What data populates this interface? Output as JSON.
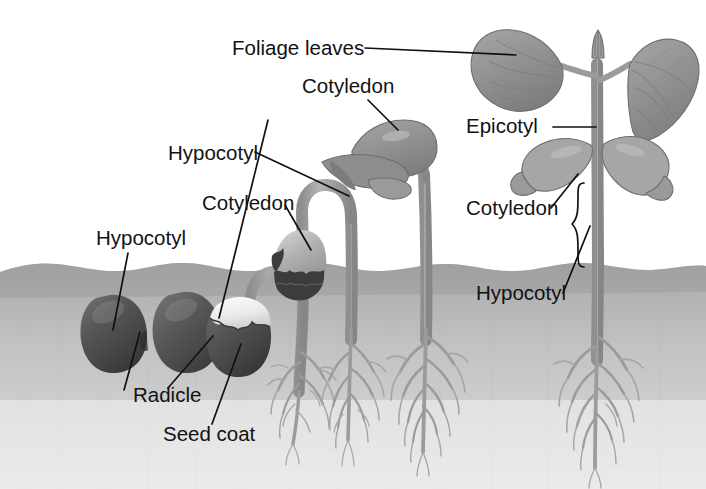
{
  "figure": {
    "background_color": "#ffffff",
    "soil_color": "#a7a7a7",
    "soil_color_light": "#c9c9c9",
    "seed_coat_color": "#4d4d4d",
    "cotyledon_color": "#9c9c9c",
    "leaf_color": "#939393",
    "stem_color": "#a0a0a0",
    "root_color": "#9b9b9b",
    "label_color": "#121212"
  },
  "labels": {
    "foliage_leaves": "Foliage leaves",
    "cotyledon_top": "Cotyledon",
    "hypocotyl_upper_left": "Hypocotyl",
    "cotyledon_mid_left": "Cotyledon",
    "hypocotyl_left": "Hypocotyl",
    "radicle": "Radicle",
    "seed_coat": "Seed coat",
    "epicotyl": "Epicotyl",
    "cotyledon_right": "Cotyledon",
    "hypocotyl_right": "Hypocotyl"
  },
  "label_positions": {
    "foliage_leaves": {
      "x": 232,
      "y": 55
    },
    "cotyledon_top": {
      "x": 302,
      "y": 93
    },
    "hypocotyl_upper_left": {
      "x": 168,
      "y": 160
    },
    "cotyledon_mid_left": {
      "x": 202,
      "y": 210
    },
    "hypocotyl_left": {
      "x": 96,
      "y": 245
    },
    "radicle": {
      "x": 133,
      "y": 402
    },
    "seed_coat": {
      "x": 163,
      "y": 441
    },
    "epicotyl": {
      "x": 466,
      "y": 133
    },
    "cotyledon_right": {
      "x": 466,
      "y": 215
    },
    "hypocotyl_right": {
      "x": 476,
      "y": 300
    }
  },
  "stages": [
    {
      "name": "seed-dormant",
      "description": "Dormant bean seed buried in soil"
    },
    {
      "name": "seed-radicle-emerging",
      "description": "Seed with radicle breaking through seed coat"
    },
    {
      "name": "seedling-hook-underground",
      "description": "Seed with hypocotyl hook and branching roots"
    },
    {
      "name": "seedling-emerging",
      "description": "Seedling pulling cotyledons above soil with hypocotyl hook"
    },
    {
      "name": "seedling-cotyledons-open",
      "description": "Seedling with expanded cotyledons and foliage leaves"
    },
    {
      "name": "young-plant",
      "description": "Young plant with epicotyl, foliage leaves and withering cotyledons"
    }
  ],
  "soil": {
    "surface_y": 266,
    "bottom_y": 489
  }
}
